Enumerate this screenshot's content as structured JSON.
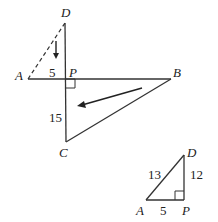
{
  "figure1": {
    "labels": {
      "D": "D",
      "A": "A",
      "P": "P",
      "B": "B",
      "C": "C"
    },
    "lengths": {
      "AP": "5",
      "PC": "15"
    }
  },
  "figure2": {
    "labels": {
      "D": "D",
      "A": "A",
      "P": "P"
    },
    "lengths": {
      "AD": "13",
      "DP": "12",
      "AP": "5"
    }
  }
}
